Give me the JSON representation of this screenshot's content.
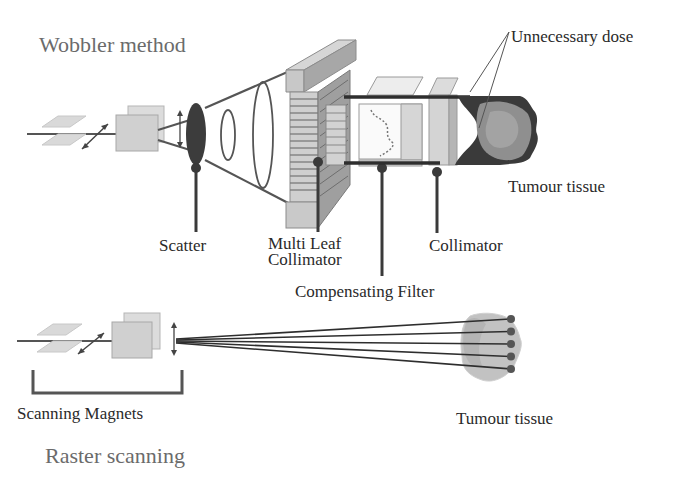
{
  "diagram": {
    "top_section": {
      "title": "Wobbler method",
      "labels": {
        "unnecessary_dose": "Unnecessary dose",
        "tumour_tissue": "Tumour tissue",
        "scatter": "Scatter",
        "multi_leaf_collimator": "Multi Leaf\nCollimator",
        "collimator": "Collimator",
        "compensating_filter": "Compensating Filter"
      }
    },
    "bottom_section": {
      "title": "Raster scanning",
      "labels": {
        "scanning_magnets": "Scanning Magnets",
        "tumour_tissue": "Tumour tissue"
      },
      "pencil_beam_count": 5
    },
    "colors": {
      "background": "#ffffff",
      "dark_stroke": "#3a3a3a",
      "beam_dark": "#2e2e2e",
      "component_fill": "#c8c8c8",
      "component_light": "#e2e2e2",
      "tumour_fill": "#8a8a8a",
      "tumour_light": "#bdbdbd"
    }
  }
}
